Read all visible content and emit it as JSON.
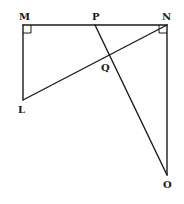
{
  "diagram": {
    "type": "geometry",
    "points": {
      "M": {
        "label": "M",
        "x": 23,
        "y": 25
      },
      "P": {
        "label": "P",
        "x": 95,
        "y": 25
      },
      "N": {
        "label": "N",
        "x": 167,
        "y": 25
      },
      "L": {
        "label": "L",
        "x": 23,
        "y": 100
      },
      "O": {
        "label": "O",
        "x": 167,
        "y": 175
      },
      "Q": {
        "label": "Q",
        "x": 109.4,
        "y": 55
      }
    },
    "segments": [
      {
        "from": "M",
        "to": "N"
      },
      {
        "from": "M",
        "to": "L"
      },
      {
        "from": "L",
        "to": "N"
      },
      {
        "from": "N",
        "to": "O"
      },
      {
        "from": "P",
        "to": "O"
      }
    ],
    "right_angles": [
      {
        "vertex": "M"
      },
      {
        "vertex": "N"
      }
    ],
    "stroke_color": "#1a1a1a",
    "background": "#ffffff"
  }
}
